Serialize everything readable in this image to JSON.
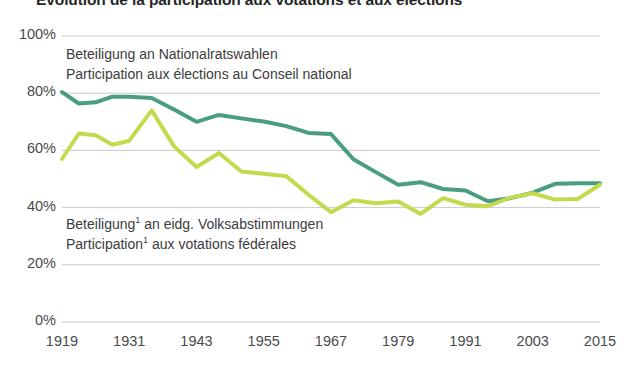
{
  "title": "Evolution de la participation aux votations et aux élections",
  "footnote": "",
  "colors": {
    "series_elections": "#4a9e7f",
    "series_votations": "#c5d94e",
    "gridline": "#c9c9c9",
    "text": "#3c3c3c",
    "background": "#ffffff"
  },
  "legend": {
    "elections": {
      "line1": "Beteiligung an Nationalratswahlen",
      "line2": "Participation aux élections au Conseil national"
    },
    "votations": {
      "line1_pre": "Beteiligung",
      "line1_sup": "1",
      "line1_post": " an eidg. Volksabstimmungen",
      "line2_pre": "Participation",
      "line2_sup": "1",
      "line2_post": " aux votations fédérales"
    }
  },
  "chart_data": {
    "type": "line",
    "title": "Evolution de la participation aux votations et aux élections",
    "xlabel": "",
    "ylabel": "",
    "xlim": [
      1919,
      2015
    ],
    "ylim": [
      0,
      100
    ],
    "grid": true,
    "legend_position": "inline-annotation",
    "y_ticks": [
      "0%",
      "20%",
      "40%",
      "60%",
      "80%",
      "100%"
    ],
    "y_tick_values": [
      0,
      20,
      40,
      60,
      80,
      100
    ],
    "x_ticks": [
      "1919",
      "1931",
      "1943",
      "1955",
      "1967",
      "1979",
      "1991",
      "2003",
      "2015"
    ],
    "x_tick_values": [
      1919,
      1931,
      1943,
      1955,
      1967,
      1979,
      1991,
      2003,
      2015
    ],
    "series": [
      {
        "name": "Beteiligung an Nationalratswahlen / Participation aux élections au Conseil national",
        "color": "#4a9e7f",
        "x": [
          1919,
          1922,
          1925,
          1928,
          1931,
          1935,
          1939,
          1943,
          1947,
          1951,
          1955,
          1959,
          1963,
          1967,
          1971,
          1975,
          1979,
          1983,
          1987,
          1991,
          1995,
          1999,
          2003,
          2007,
          2011,
          2015
        ],
        "values": [
          80.4,
          76.4,
          76.8,
          78.8,
          78.8,
          78.3,
          74.3,
          70.0,
          72.4,
          71.2,
          70.1,
          68.5,
          66.1,
          65.7,
          56.9,
          52.4,
          48.0,
          48.9,
          46.5,
          46.0,
          42.2,
          43.3,
          45.2,
          48.3,
          48.5,
          48.5
        ],
        "marker": "none",
        "linewidth": 4
      },
      {
        "name": "Beteiligung an eidg. Volksabstimmungen / Participation aux votations fédérales",
        "color": "#c5d94e",
        "x": [
          1919,
          1922,
          1925,
          1928,
          1931,
          1935,
          1939,
          1943,
          1947,
          1951,
          1955,
          1959,
          1963,
          1967,
          1971,
          1975,
          1979,
          1983,
          1987,
          1991,
          1995,
          1999,
          2003,
          2007,
          2011,
          2015
        ],
        "values": [
          57.0,
          65.9,
          65.3,
          62.0,
          63.4,
          74.0,
          61.4,
          54.2,
          59.1,
          52.6,
          51.8,
          51.0,
          44.5,
          38.4,
          42.6,
          41.5,
          42.1,
          37.8,
          43.3,
          41.0,
          40.5,
          43.5,
          45.0,
          42.8,
          43.0,
          48.0
        ],
        "marker": "none",
        "linewidth": 4
      }
    ]
  }
}
